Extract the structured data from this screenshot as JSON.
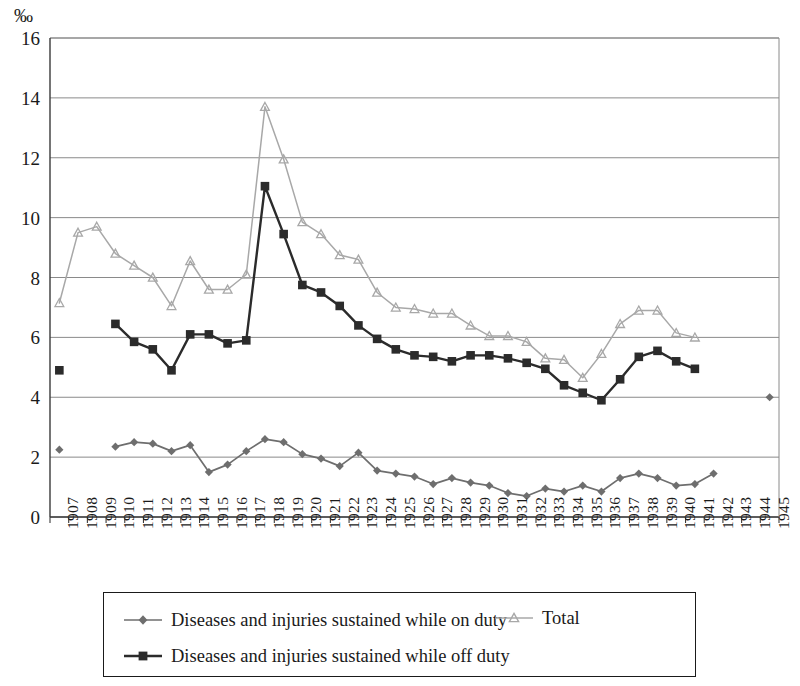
{
  "chart_data": {
    "type": "line",
    "title": "",
    "subtitle": "",
    "xlabel": "",
    "ylabel": "",
    "unit_label": "‰",
    "ylim": [
      0,
      16
    ],
    "ytick_step": 2,
    "ytick_labels": [
      "0",
      "2",
      "4",
      "6",
      "8",
      "10",
      "12",
      "14",
      "16"
    ],
    "grid": true,
    "grid_axis": "y",
    "legend_position": "bottom",
    "categories": [
      "1907",
      "1908",
      "1909",
      "1910",
      "1911",
      "1912",
      "1913",
      "1914",
      "1915",
      "1916",
      "1917",
      "1918",
      "1919",
      "1920",
      "1921",
      "1922",
      "1923",
      "1924",
      "1925",
      "1926",
      "1927",
      "1928",
      "1929",
      "1930",
      "1931",
      "1932",
      "1933",
      "1934",
      "1935",
      "1936",
      "1937",
      "1938",
      "1939",
      "1940",
      "1941",
      "1942",
      "1943",
      "1944",
      "1945"
    ],
    "series": [
      {
        "name": "Diseases and injuries sustained while on duty",
        "marker": "diamond",
        "color": "#6e6e6e",
        "values": [
          2.25,
          null,
          null,
          2.35,
          2.5,
          2.45,
          2.2,
          2.4,
          1.5,
          1.75,
          2.2,
          2.6,
          2.5,
          2.1,
          1.95,
          1.7,
          2.15,
          1.55,
          1.45,
          1.35,
          1.1,
          1.3,
          1.15,
          1.05,
          0.8,
          0.7,
          0.95,
          0.85,
          1.05,
          0.85,
          1.3,
          1.45,
          1.3,
          1.05,
          1.1,
          1.45,
          null,
          null,
          4.0
        ]
      },
      {
        "name": "Diseases and injuries sustained while off duty",
        "marker": "square",
        "color": "#2b2b2b",
        "values": [
          4.9,
          null,
          null,
          6.45,
          5.85,
          5.6,
          4.9,
          6.1,
          6.1,
          5.8,
          5.9,
          11.05,
          9.45,
          7.75,
          7.5,
          7.05,
          6.4,
          5.95,
          5.6,
          5.4,
          5.35,
          5.2,
          5.4,
          5.4,
          5.3,
          5.15,
          4.95,
          4.4,
          4.15,
          3.9,
          4.6,
          5.35,
          5.55,
          5.2,
          4.95,
          null,
          null,
          null,
          null
        ]
      },
      {
        "name": "Total",
        "marker": "triangle",
        "color": "#a8a8a8",
        "values": [
          7.15,
          9.5,
          9.7,
          8.8,
          8.4,
          8.0,
          7.05,
          8.55,
          7.6,
          7.6,
          8.1,
          13.7,
          11.95,
          9.85,
          9.45,
          8.75,
          8.6,
          7.5,
          7.0,
          6.95,
          6.8,
          6.8,
          6.4,
          6.05,
          6.05,
          5.85,
          5.3,
          5.25,
          4.65,
          5.45,
          6.45,
          6.9,
          6.9,
          6.15,
          6.0,
          null,
          null,
          null,
          null
        ]
      }
    ]
  },
  "legend": {
    "entries": [
      {
        "label": "Diseases and injuries sustained while on duty",
        "marker": "diamond",
        "color": "#6e6e6e"
      },
      {
        "label": "Diseases and injuries sustained while off duty",
        "marker": "square",
        "color": "#2b2b2b"
      },
      {
        "label": "Total",
        "marker": "triangle",
        "color": "#a8a8a8"
      }
    ]
  }
}
